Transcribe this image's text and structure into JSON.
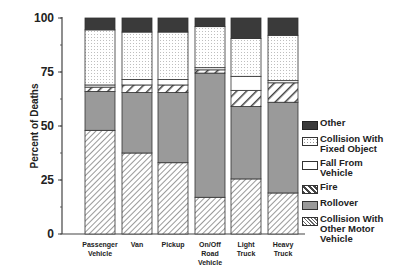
{
  "chart_data": {
    "type": "bar",
    "stacked": true,
    "title": "",
    "xlabel": "",
    "ylabel": "Percent of Deaths",
    "ylim": [
      0,
      100
    ],
    "yticks": [
      0,
      25,
      50,
      75,
      100
    ],
    "grid": false,
    "legend_position": "right",
    "categories": [
      "Passenger Vehicle",
      "Van",
      "Pickup",
      "On/Off Road Vehicle",
      "Light Truck",
      "Heavy Truck"
    ],
    "category_lines": [
      [
        "Passenger",
        "Vehicle"
      ],
      [
        "Van"
      ],
      [
        "Pickup"
      ],
      [
        "On/Off",
        "Road",
        "Vehicle"
      ],
      [
        "Light",
        "Truck"
      ],
      [
        "Heavy",
        "Truck"
      ]
    ],
    "series": [
      {
        "name": "Collision With Other Motor Vehicle",
        "values": [
          48,
          37.5,
          33,
          17,
          25.5,
          19
        ]
      },
      {
        "name": "Rollover",
        "values": [
          18,
          28,
          32.5,
          57.5,
          33.5,
          42
        ]
      },
      {
        "name": "Fire",
        "values": [
          2,
          3.5,
          3.5,
          1.5,
          7.5,
          9
        ]
      },
      {
        "name": "Fall From Vehicle",
        "values": [
          1,
          2.5,
          2.5,
          1,
          6.5,
          1
        ]
      },
      {
        "name": "Collision With Fixed Object",
        "values": [
          25.5,
          22,
          22,
          19,
          17.5,
          21
        ]
      },
      {
        "name": "Other",
        "values": [
          5.5,
          6.5,
          6.5,
          4,
          9.5,
          8
        ]
      }
    ]
  },
  "legend": {
    "items": [
      {
        "label_lines": [
          "Other"
        ],
        "pattern": "dark"
      },
      {
        "label_lines": [
          "Collision With",
          "Fixed Object"
        ],
        "pattern": "dots"
      },
      {
        "label_lines": [
          "Fall From",
          "Vehicle"
        ],
        "pattern": "white"
      },
      {
        "label_lines": [
          "Fire"
        ],
        "pattern": "wide-hatch"
      },
      {
        "label_lines": [
          "Rollover"
        ],
        "pattern": "gray"
      },
      {
        "label_lines": [
          "Collision With",
          "Other Motor",
          "Vehicle"
        ],
        "pattern": "fine-hatch"
      }
    ]
  },
  "colors": {
    "other": "#3a3a3a",
    "rollover": "#9a9a9a",
    "axis": "#444444"
  }
}
